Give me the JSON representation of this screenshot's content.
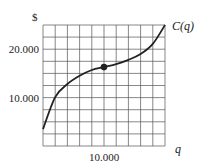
{
  "chart_data": {
    "type": "line",
    "title": "",
    "xlabel": "q",
    "ylabel": "$",
    "series": [
      {
        "name": "C(q)",
        "x": [
          0,
          2000,
          4000,
          6000,
          8000,
          10000,
          12000,
          14000,
          16000,
          18000,
          20000
        ],
        "values": [
          3500,
          10100,
          12800,
          14500,
          15700,
          16300,
          16900,
          17800,
          19000,
          21100,
          25000
        ]
      }
    ],
    "highlight_point": {
      "x": 10000,
      "y": 16300,
      "label": "inflection point"
    },
    "x_ticks": [
      {
        "value": 10000,
        "label": "10.000"
      }
    ],
    "y_ticks": [
      {
        "value": 10000,
        "label": "10.000"
      },
      {
        "value": 20000,
        "label": "20.000"
      }
    ],
    "xlim": [
      0,
      20000
    ],
    "ylim": [
      0,
      25000
    ],
    "grid": true,
    "grid_x_step": 2000,
    "grid_y_step": 2500,
    "legend": null,
    "curve_label": "C(q)"
  },
  "colors": {
    "curve": "#222222",
    "grid": "#555555",
    "text": "#222222",
    "background": "#ffffff"
  }
}
